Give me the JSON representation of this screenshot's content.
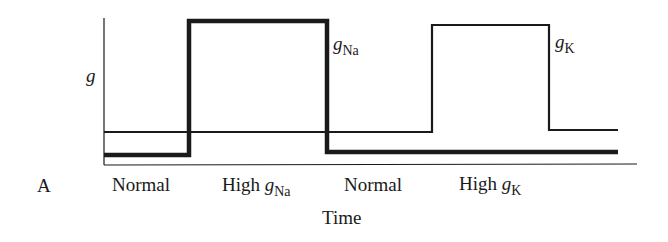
{
  "figure": {
    "panel_label": "A",
    "y_axis_label": "g",
    "x_axis_label": "Time",
    "trace_labels": {
      "gNa": {
        "base": "g",
        "sub": "Na"
      },
      "gK": {
        "base": "g",
        "sub": "K"
      }
    },
    "phase_labels": [
      {
        "text": "Normal"
      },
      {
        "text": "High ",
        "var": "g",
        "sub": "Na"
      },
      {
        "text": "Normal"
      },
      {
        "text": "High ",
        "var": "g",
        "sub": "K"
      }
    ],
    "colors": {
      "line": "#1a1a1a",
      "background": "#ffffff"
    }
  },
  "traces": {
    "gNa": {
      "style": "thick",
      "points": [
        [
          104,
          155
        ],
        [
          189,
          155
        ],
        [
          189,
          21
        ],
        [
          327,
          21
        ],
        [
          327,
          152
        ],
        [
          618,
          152
        ]
      ]
    },
    "gK": {
      "style": "thin",
      "points": [
        [
          104,
          132
        ],
        [
          432,
          132
        ],
        [
          432,
          25
        ],
        [
          549,
          25
        ],
        [
          549,
          130
        ],
        [
          618,
          130
        ]
      ]
    }
  }
}
